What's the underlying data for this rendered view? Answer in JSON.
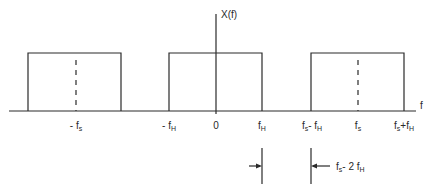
{
  "diagram": {
    "y_axis_label": "X(f)",
    "x_axis_label": "f",
    "origin_label": "0",
    "stroke_color": "#2a2a2a",
    "tick_labels": [
      {
        "id": "neg_fs",
        "main": "- f",
        "sub": "s",
        "suffix": ""
      },
      {
        "id": "neg_fh",
        "main": "- f",
        "sub": "H",
        "suffix": ""
      },
      {
        "id": "zero",
        "main": "0",
        "sub": "",
        "suffix": ""
      },
      {
        "id": "fh",
        "main": "f",
        "sub": "H",
        "suffix": ""
      },
      {
        "id": "fs_minus_fh",
        "main": "f",
        "sub": "s",
        "suffix": "- f",
        "sub2": "H"
      },
      {
        "id": "fs",
        "main": "f",
        "sub": "s",
        "suffix": ""
      },
      {
        "id": "fs_plus_fh",
        "main": "f",
        "sub": "s",
        "suffix": "+f",
        "sub2": "H"
      }
    ],
    "spectral_copies": [
      {
        "center": "-fs",
        "from": "-fs-fH",
        "to": "-fs+fH"
      },
      {
        "center": "0",
        "from": "-fH",
        "to": "fH"
      },
      {
        "center": "fs",
        "from": "fs-fH",
        "to": "fs+fH"
      }
    ],
    "guard_band": {
      "label_main": "f",
      "label_sub": "s",
      "label_mid": "- 2 f",
      "label_sub2": "H"
    }
  }
}
